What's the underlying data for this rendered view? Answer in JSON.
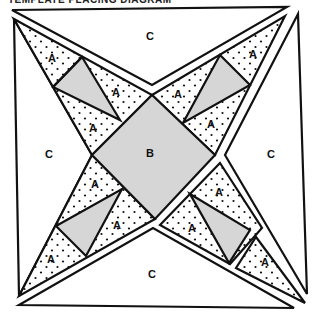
{
  "caption": "TEMPLATE PLACING DIAGRAM",
  "colors": {
    "line": "#111111",
    "gray_fill": "#d6d6d6",
    "background": "#ffffff",
    "dot": "#111111"
  },
  "labels": {
    "c_top": "C",
    "c_left": "C",
    "c_right": "C",
    "c_bottom": "C",
    "b_center": "B",
    "a_tl_1": "A",
    "a_tl_2": "A",
    "a_tl_3": "A",
    "a_tr_1": "A",
    "a_tr_2": "A",
    "a_tr_3": "A",
    "a_bl_1": "A",
    "a_bl_2": "A",
    "a_bl_3": "A",
    "a_br_1": "A",
    "a_br_2": "A",
    "a_br_3": "A"
  },
  "pieces": {
    "C": "Plain white triangles forming the sides of the block (4)",
    "B": "Gray center square (1)",
    "A": "Dotted triangles in the star points (12)",
    "gray_parallelograms": "Gray diamond pieces in each star point (4)"
  }
}
